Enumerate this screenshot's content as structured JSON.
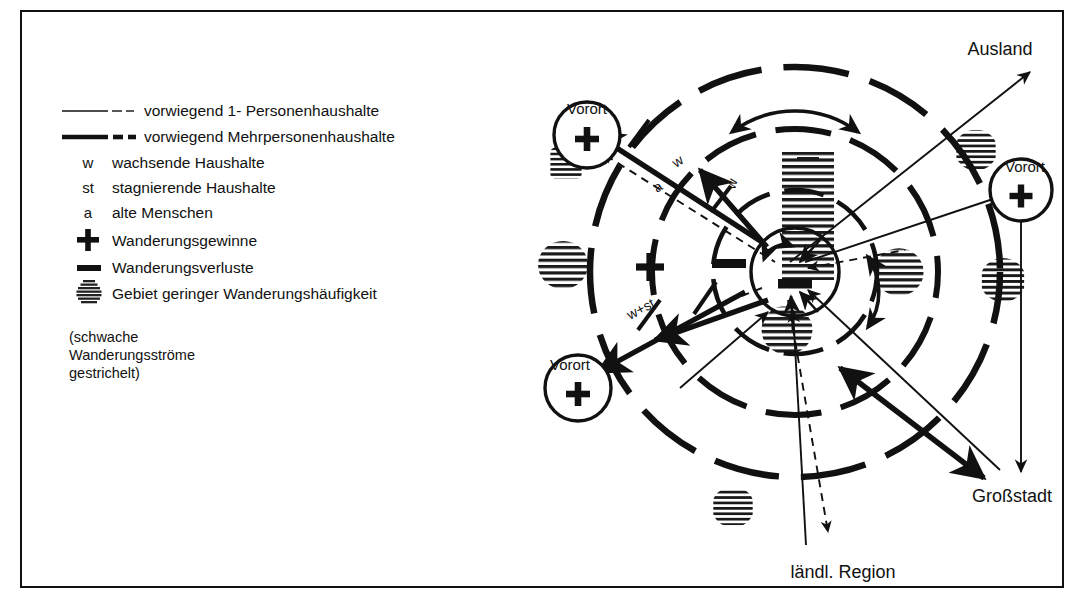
{
  "figure": {
    "type": "diagram"
  },
  "legend": {
    "items": [
      {
        "symbol": "thin-line-dashed",
        "label": "vorwiegend 1- Personenhaushalte"
      },
      {
        "symbol": "thick-line-dashed",
        "label": "vorwiegend Mehrpersonenhaushalte"
      },
      {
        "symbol": "w",
        "label": "wachsende Haushalte"
      },
      {
        "symbol": "st",
        "label": "stagnierende Haushalte"
      },
      {
        "symbol": "a",
        "label": "alte Menschen"
      },
      {
        "symbol": "plus",
        "label": "Wanderungsgewinne"
      },
      {
        "symbol": "minus",
        "label": "Wanderungsverluste"
      },
      {
        "symbol": "hatched-blob",
        "label": "Gebiet geringer Wanderungshäufigkeit"
      }
    ],
    "note": [
      "(schwache",
      "Wanderungsströme",
      "gestrichelt)"
    ]
  },
  "map": {
    "outer_labels": [
      {
        "name": "ausland",
        "text": "Ausland"
      },
      {
        "name": "grossstadt",
        "text": "Großstadt"
      },
      {
        "name": "laendliche-region",
        "text": "ländl. Region"
      }
    ],
    "nodes": [
      {
        "name": "vorort-top-left",
        "text": "Vorort",
        "sign": "+"
      },
      {
        "name": "vorort-bottom-left",
        "text": "Vorort",
        "sign": "+"
      },
      {
        "name": "vorort-right",
        "text": "Vorort",
        "sign": "+"
      },
      {
        "name": "city-core",
        "text": "",
        "sign": "−"
      }
    ],
    "zone_signs": [
      {
        "name": "outer-ring-gain",
        "sign": "+"
      },
      {
        "name": "middle-ring-loss",
        "sign": "−"
      },
      {
        "name": "core-loss",
        "sign": "−"
      }
    ],
    "flow_labels": [
      {
        "name": "flow-w",
        "text": "w"
      },
      {
        "name": "flow-a",
        "text": "a"
      },
      {
        "name": "flow-w-st",
        "text": "w+st"
      }
    ]
  },
  "colors": {
    "ink": "#111111",
    "paper": "#ffffff",
    "hatch": "#333333"
  }
}
